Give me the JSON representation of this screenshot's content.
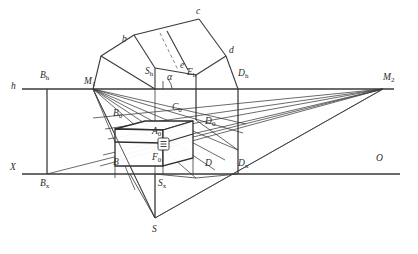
{
  "figure": {
    "line_color": "#3a3a3a",
    "dashed_color": "#6b6b6b",
    "label_color": "#2b2b2b",
    "background": "#ffffff",
    "width": 418,
    "height": 254
  },
  "axes": {
    "horizon": {
      "label": "h",
      "y": 89,
      "x1": 22,
      "x2": 394
    },
    "ground": {
      "label": "X",
      "y": 174,
      "x1": 22,
      "x2": 400
    }
  },
  "labels": [
    {
      "id": "h",
      "text": "h",
      "sub": "",
      "x": 11,
      "y": 83,
      "italic": true
    },
    {
      "id": "X",
      "text": "X",
      "sub": "",
      "x": 10,
      "y": 164,
      "italic": true
    },
    {
      "id": "Bh",
      "text": "B",
      "sub": "h",
      "x": 40,
      "y": 72,
      "italic": true
    },
    {
      "id": "Bx",
      "text": "B",
      "sub": "x",
      "x": 40,
      "y": 180,
      "italic": true
    },
    {
      "id": "M1",
      "text": "M",
      "sub": "1",
      "x": 84,
      "y": 78,
      "italic": true
    },
    {
      "id": "M2",
      "text": "M",
      "sub": "2",
      "x": 383,
      "y": 74,
      "italic": true
    },
    {
      "id": "Sh",
      "text": "S",
      "sub": "h",
      "x": 146,
      "y": 68,
      "italic": true
    },
    {
      "id": "Sx",
      "text": "S",
      "sub": "x",
      "x": 158,
      "y": 180,
      "italic": true
    },
    {
      "id": "S",
      "text": "S",
      "sub": "",
      "x": 152,
      "y": 226,
      "italic": true
    },
    {
      "id": "Eh",
      "text": "E",
      "sub": "h",
      "x": 188,
      "y": 69,
      "italic": true
    },
    {
      "id": "Dh",
      "text": "D",
      "sub": "h",
      "x": 238,
      "y": 70,
      "italic": true
    },
    {
      "id": "Dx",
      "text": "D",
      "sub": "x",
      "x": 238,
      "y": 160,
      "italic": true
    },
    {
      "id": "D",
      "text": "D",
      "sub": "",
      "x": 205,
      "y": 160,
      "italic": true
    },
    {
      "id": "D0",
      "text": "D",
      "sub": "0",
      "x": 205,
      "y": 118,
      "italic": true
    },
    {
      "id": "B",
      "text": "B",
      "sub": "",
      "x": 113,
      "y": 159,
      "italic": true
    },
    {
      "id": "B0",
      "text": "B",
      "sub": "0",
      "x": 113,
      "y": 110,
      "italic": true
    },
    {
      "id": "A0",
      "text": "A",
      "sub": "0",
      "x": 152,
      "y": 128,
      "italic": true
    },
    {
      "id": "C0",
      "text": "C",
      "sub": "0",
      "x": 172,
      "y": 104,
      "italic": true
    },
    {
      "id": "F0",
      "text": "F",
      "sub": "0",
      "x": 152,
      "y": 154,
      "italic": true
    },
    {
      "id": "O",
      "text": "O",
      "sub": "",
      "x": 376,
      "y": 155,
      "italic": true
    },
    {
      "id": "b",
      "text": "b",
      "sub": "",
      "x": 122,
      "y": 36,
      "italic": true
    },
    {
      "id": "c",
      "text": "c",
      "sub": "",
      "x": 196,
      "y": 8,
      "italic": true
    },
    {
      "id": "d",
      "text": "d",
      "sub": "",
      "x": 229,
      "y": 47,
      "italic": true
    },
    {
      "id": "e",
      "text": "e",
      "sub": "",
      "x": 180,
      "y": 62,
      "italic": true
    },
    {
      "id": "alpha",
      "text": "α",
      "sub": "",
      "x": 167,
      "y": 73,
      "italic": true
    }
  ],
  "points": {
    "Bh": [
      47,
      89
    ],
    "Bx": [
      47,
      174
    ],
    "M1": [
      93,
      89
    ],
    "M2": [
      383,
      89
    ],
    "Sh": [
      155,
      89
    ],
    "Sx": [
      155,
      174
    ],
    "S": [
      155,
      218
    ],
    "Eh": [
      196,
      89
    ],
    "Dh": [
      238,
      89
    ],
    "Dx": [
      238,
      174
    ],
    "b": [
      117,
      46
    ],
    "c": [
      199,
      19
    ],
    "d": [
      226,
      56
    ],
    "e": [
      188,
      70
    ],
    "box_near_top_left": [
      115,
      129
    ],
    "box_near_top_right": [
      193,
      121
    ],
    "box_near_bot_left": [
      115,
      166
    ],
    "box_near_bot_right": [
      193,
      160
    ]
  },
  "annotations": {
    "angle_symbol": "α",
    "dashed_diagonal": true,
    "clasp_detail": "box-clasp"
  }
}
